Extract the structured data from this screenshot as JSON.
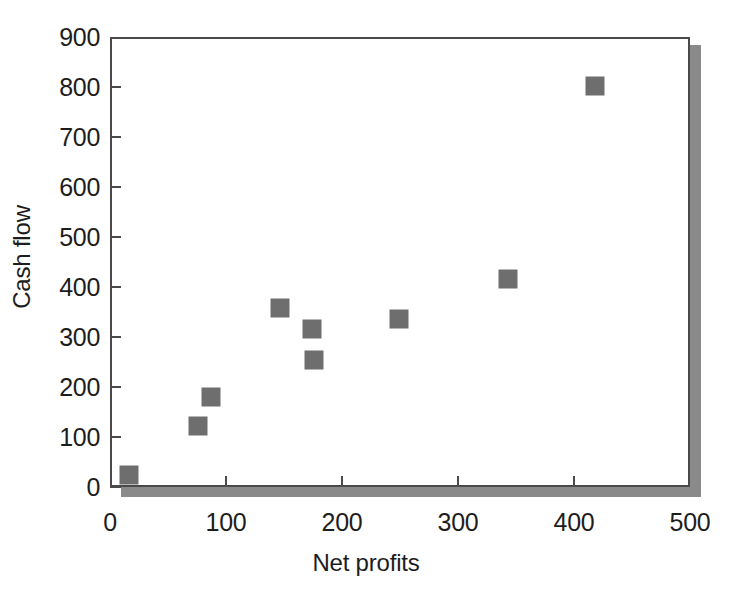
{
  "chart_data": {
    "type": "scatter",
    "title": "",
    "xlabel": "Net profits",
    "ylabel": "Cash flow",
    "xlim": [
      0,
      500
    ],
    "ylim": [
      0,
      900
    ],
    "xticks": [
      0,
      100,
      200,
      300,
      400,
      500
    ],
    "yticks": [
      0,
      100,
      200,
      300,
      400,
      500,
      600,
      700,
      800,
      900
    ],
    "grid": false,
    "legend": null,
    "marker_shape": "square",
    "marker_color": "#6e6e6e",
    "axis_color": "#4a4a4a",
    "shadow_color": "#8a8a8a",
    "series": [
      {
        "name": "",
        "points": [
          {
            "x": 15,
            "y": 28
          },
          {
            "x": 74,
            "y": 126
          },
          {
            "x": 85,
            "y": 184
          },
          {
            "x": 145,
            "y": 362
          },
          {
            "x": 172,
            "y": 320
          },
          {
            "x": 174,
            "y": 258
          },
          {
            "x": 247,
            "y": 341
          },
          {
            "x": 341,
            "y": 421
          },
          {
            "x": 416,
            "y": 807
          }
        ]
      }
    ]
  }
}
